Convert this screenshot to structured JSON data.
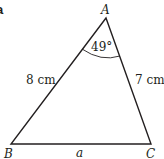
{
  "part_label": "a",
  "triangle": {
    "vertices": {
      "A": {
        "label": "A",
        "x": 106,
        "y": 18
      },
      "B": {
        "label": "B",
        "x": 11,
        "y": 144
      },
      "C": {
        "label": "C",
        "x": 151,
        "y": 144
      }
    },
    "sides": {
      "AB": {
        "label": "8 cm"
      },
      "AC": {
        "label": "7 cm"
      },
      "BC": {
        "label": "a"
      }
    },
    "angle_A": {
      "label": "49°"
    }
  },
  "colors": {
    "line": "#231f20",
    "background": "#ffffff"
  }
}
